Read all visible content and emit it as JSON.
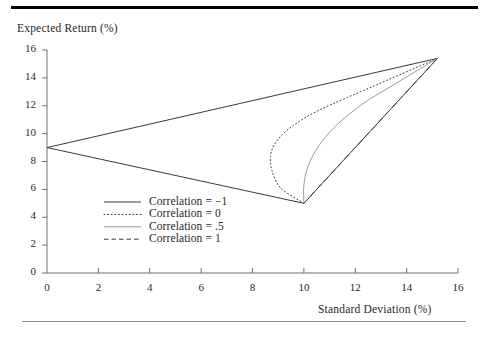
{
  "figure": {
    "top_rule_color": "#000000",
    "bottom_rule_color": "#8d8d8d",
    "background": "#ffffff"
  },
  "chart_data": {
    "type": "line",
    "title": "",
    "xlabel": "Standard Deviation (%)",
    "ylabel": "Expected Return (%)",
    "xlim": [
      0,
      16
    ],
    "ylim": [
      0,
      16
    ],
    "xticks": [
      0,
      2,
      4,
      6,
      8,
      10,
      12,
      14,
      16
    ],
    "yticks": [
      0,
      2,
      4,
      6,
      8,
      10,
      12,
      14,
      16
    ],
    "xtick_labels": [
      "0",
      "2",
      "4",
      "6",
      "8",
      "10",
      "12",
      "14",
      "16"
    ],
    "ytick_labels": [
      "0",
      "2",
      "4",
      "6",
      "8",
      "10",
      "12",
      "14",
      "16"
    ],
    "grid": false,
    "legend_position": "lower-left-inside",
    "endpoints": {
      "asset_low_risk": {
        "x": 0,
        "y": 9
      },
      "asset_high_risk": {
        "x": 15.2,
        "y": 15.4
      },
      "min_variance_vertex": {
        "x": 10,
        "y": 5
      }
    },
    "series": [
      {
        "name": "Correlation = −1",
        "legend_label": "Correlation = −1",
        "style": "solid",
        "color": "#3a3a3a",
        "width": 1.0,
        "points": [
          [
            0,
            9
          ],
          [
            5.1,
            12.2
          ],
          [
            10.1,
            15.4
          ],
          [
            12.6,
            10.2
          ],
          [
            15.2,
            5.0
          ],
          [
            10.0,
            5.0
          ],
          [
            0,
            9
          ]
        ],
        "segments": [
          [
            [
              0,
              9
            ],
            [
              15.2,
              15.4
            ]
          ],
          [
            [
              0,
              9
            ],
            [
              10.0,
              5.0
            ]
          ],
          [
            [
              10.0,
              5.0
            ],
            [
              15.2,
              15.4
            ]
          ]
        ]
      },
      {
        "name": "Correlation = 0",
        "legend_label": "Correlation = 0",
        "style": "dotted",
        "color": "#3a3a3a",
        "width": 1.0,
        "points": [
          [
            10.0,
            5.0
          ],
          [
            9.1,
            6.1
          ],
          [
            8.75,
            7.4
          ],
          [
            8.72,
            8.6
          ],
          [
            9.0,
            9.6
          ],
          [
            9.6,
            10.6
          ],
          [
            10.5,
            11.6
          ],
          [
            11.7,
            12.6
          ],
          [
            13.2,
            13.8
          ],
          [
            15.2,
            15.4
          ]
        ]
      },
      {
        "name": "Correlation = .5",
        "legend_label": "Correlation = .5",
        "style": "solid",
        "color": "#9a9a9a",
        "width": 1.0,
        "points": [
          [
            10.0,
            5.0
          ],
          [
            10.0,
            6.3
          ],
          [
            10.15,
            7.6
          ],
          [
            10.5,
            8.9
          ],
          [
            11.0,
            10.1
          ],
          [
            11.7,
            11.3
          ],
          [
            12.5,
            12.4
          ],
          [
            13.4,
            13.4
          ],
          [
            14.3,
            14.4
          ],
          [
            15.2,
            15.4
          ]
        ]
      },
      {
        "name": "Correlation = 1",
        "legend_label": "Correlation = 1",
        "style": "dashed",
        "color": "#3a3a3a",
        "width": 1.0,
        "points": [
          [
            10.0,
            5.0
          ],
          [
            15.2,
            15.4
          ]
        ]
      }
    ]
  },
  "legend": {
    "items": [
      {
        "label": "Correlation = −1",
        "style": "solid",
        "color": "#3a3a3a"
      },
      {
        "label": "Correlation = 0",
        "style": "dotted",
        "color": "#3a3a3a"
      },
      {
        "label": "Correlation = .5",
        "style": "solid",
        "color": "#9a9a9a"
      },
      {
        "label": "Correlation = 1",
        "style": "dashed",
        "color": "#3a3a3a"
      }
    ]
  }
}
